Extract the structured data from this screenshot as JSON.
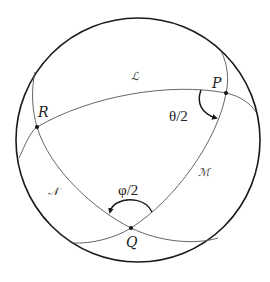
{
  "diagram": {
    "title": "",
    "sphere": {
      "cx": 138,
      "cy": 140,
      "r": 122
    },
    "points": [
      {
        "id": "P",
        "label": "P",
        "x": 226,
        "y": 93
      },
      {
        "id": "Q",
        "label": "Q",
        "x": 131,
        "y": 228
      },
      {
        "id": "R",
        "label": "R",
        "x": 37,
        "y": 127
      }
    ],
    "great_circles": [
      {
        "id": "L",
        "label": "ℒ",
        "through": [
          "R",
          "P"
        ]
      },
      {
        "id": "M",
        "label": "ℳ",
        "through": [
          "P",
          "Q"
        ]
      },
      {
        "id": "N",
        "label": "𝒩",
        "through": [
          "R",
          "Q"
        ]
      }
    ],
    "angles": [
      {
        "at": "P",
        "label": "θ/2"
      },
      {
        "at": "Q",
        "label": "φ/2"
      }
    ],
    "colors": {
      "sphere_outline": "#1a1a1a",
      "great_circle": "#555555",
      "background": "#ffffff"
    }
  }
}
